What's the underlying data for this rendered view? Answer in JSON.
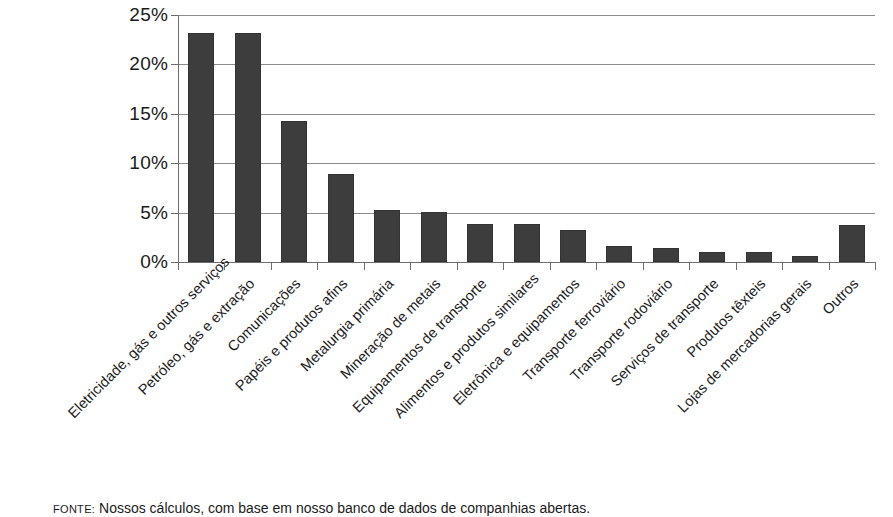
{
  "chart_data": {
    "type": "bar",
    "title": "",
    "subtitle": "",
    "xlabel": "",
    "ylabel": "",
    "ylim": [
      0,
      25
    ],
    "yticks": [
      0,
      5,
      10,
      15,
      20,
      25
    ],
    "ytick_labels": [
      "0%",
      "5%",
      "10%",
      "15%",
      "20%",
      "25%"
    ],
    "grid": true,
    "legend": false,
    "legend_position": "none",
    "value_unit": "%",
    "bar_color": "#3d3d3d",
    "gridline_color": "#8c8c8c",
    "axis_color": "#6e6e6e",
    "categories": [
      "Eletricidade, gás e outros serviços",
      "Petróleo, gás e extração",
      "Comunicações",
      "Papéis e produtos afins",
      "Metalurgia primária",
      "Mineração de metais",
      "Equipamentos de transporte",
      "Alimentos e produtos similares",
      "Eletrônica e equipamentos",
      "Transporte ferroviário",
      "Transporte rodoviário",
      "Serviços de transporte",
      "Produtos têxteis",
      "Lojas de mercadorias gerais",
      "Outros"
    ],
    "values": [
      23.2,
      23.2,
      14.3,
      8.9,
      5.3,
      5.1,
      3.8,
      3.8,
      3.2,
      1.6,
      1.4,
      1.0,
      1.0,
      0.6,
      3.7
    ]
  },
  "footnote": {
    "source_label": "FONTE:",
    "text": " Nossos cálculos, com base em nosso banco de dados de companhias abertas."
  }
}
